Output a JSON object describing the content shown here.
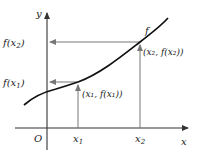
{
  "diagram": {
    "axes": {
      "x_label": "x",
      "y_label": "y",
      "origin_label": "O"
    },
    "function_label": "f",
    "points": [
      {
        "name": "point-1",
        "x_tick": "x",
        "x_sub": "1",
        "y_tick_f": "f(x",
        "y_tick_sub": "1",
        "y_tick_close": ")",
        "coord_label": "(x₁, f(x₁))"
      },
      {
        "name": "point-2",
        "x_tick": "x",
        "x_sub": "2",
        "y_tick_f": "f(x",
        "y_tick_sub": "2",
        "y_tick_close": ")",
        "coord_label": "(x₂, f(x₂))"
      }
    ],
    "colors": {
      "axis": "#333333",
      "curve": "#111111",
      "guide_lines": "#777777"
    }
  }
}
